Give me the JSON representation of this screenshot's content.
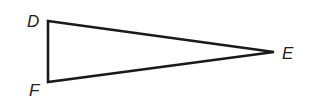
{
  "diagram": {
    "type": "triangle",
    "stroke_color": "#1a1a1a",
    "vertices": [
      {
        "name": "D",
        "x": 48,
        "y": 21,
        "label_x": 27,
        "label_y": 27
      },
      {
        "name": "E",
        "x": 274,
        "y": 52,
        "label_x": 282,
        "label_y": 59
      },
      {
        "name": "F",
        "x": 48,
        "y": 82,
        "label_x": 29,
        "label_y": 96
      }
    ],
    "labels": {
      "D": "D",
      "E": "E",
      "F": "F"
    }
  }
}
